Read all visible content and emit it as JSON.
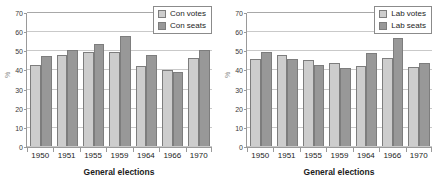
{
  "chart_data": [
    {
      "type": "bar",
      "panel": "left",
      "title": "",
      "xlabel": "General elections",
      "ylabel": "%",
      "ylim": [
        0,
        70
      ],
      "yticks": [
        0,
        10,
        20,
        30,
        40,
        50,
        60,
        70
      ],
      "grid": true,
      "legend_position": "top-right",
      "categories": [
        "1950",
        "1951",
        "1955",
        "1959",
        "1964",
        "1966",
        "1970"
      ],
      "series": [
        {
          "name": "Con votes",
          "color": "#cdcdcd",
          "values": [
            42.7,
            47.8,
            49.4,
            49.4,
            41.9,
            40.1,
            46.4
          ]
        },
        {
          "name": "Con seats",
          "color": "#989898",
          "values": [
            47.4,
            50.6,
            53.8,
            57.9,
            47.8,
            38.8,
            50.5
          ]
        }
      ]
    },
    {
      "type": "bar",
      "panel": "right",
      "title": "",
      "xlabel": "General elections",
      "ylabel": "%",
      "ylim": [
        0,
        70
      ],
      "yticks": [
        0,
        10,
        20,
        30,
        40,
        50,
        60,
        70
      ],
      "grid": true,
      "legend_position": "top-right",
      "categories": [
        "1950",
        "1951",
        "1955",
        "1959",
        "1964",
        "1966",
        "1970"
      ],
      "series": [
        {
          "name": "Lab votes",
          "color": "#cdcdcd",
          "values": [
            45.8,
            48.0,
            45.2,
            43.8,
            42.2,
            46.2,
            41.4
          ]
        },
        {
          "name": "Lab seats",
          "color": "#989898",
          "values": [
            49.6,
            45.6,
            42.4,
            41.0,
            49.0,
            56.9,
            43.6
          ]
        }
      ]
    }
  ]
}
